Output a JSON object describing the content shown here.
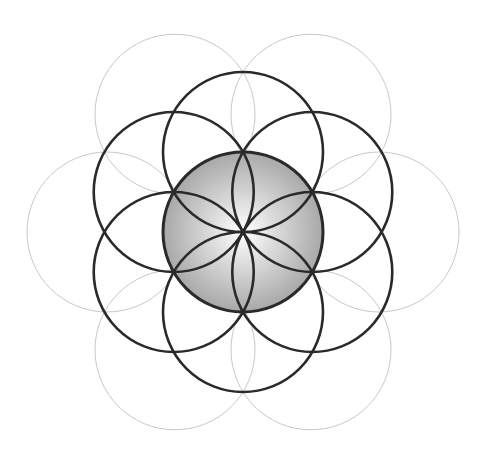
{
  "diagram": {
    "center": [
      243,
      232
    ],
    "radius": 80,
    "colors": {
      "background": "#ffffff",
      "dark_stroke": "#2a2a2a",
      "light_stroke": "#c8c8c8",
      "inner_petal_stroke": "#9a9a9a",
      "fill_center": "#ffffff",
      "fill_edge": "#a8a8a8"
    },
    "rings": {
      "center_circle": {
        "label": "central filled circle",
        "stroke_width": 3
      },
      "dark_ring": {
        "label": "inner ring of six dark circles",
        "count": 6,
        "distance_factor": 1.0,
        "start_angle_deg": 90,
        "stroke_width": 2.6
      },
      "light_ring": {
        "label": "outer ring of six light circles",
        "count": 6,
        "distance_factor": 1.7,
        "start_angle_deg": 0,
        "stroke_width": 1
      },
      "inner_petals": {
        "label": "six petal arcs inside central circle",
        "count": 6,
        "stroke_width": 1
      }
    }
  }
}
